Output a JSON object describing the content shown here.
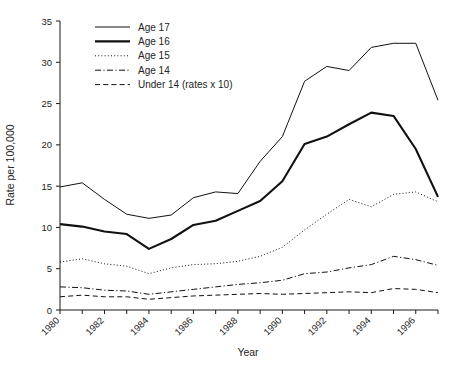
{
  "chart_data": {
    "type": "line",
    "title": "",
    "xlabel": "Year",
    "ylabel": "Rate per 100,000",
    "xlim": [
      1980,
      1997
    ],
    "ylim": [
      0,
      35
    ],
    "yticks": [
      0,
      5,
      10,
      15,
      20,
      25,
      30,
      35
    ],
    "xticks": [
      1980,
      1981,
      1982,
      1983,
      1984,
      1985,
      1986,
      1987,
      1988,
      1989,
      1990,
      1991,
      1992,
      1993,
      1994,
      1995,
      1996,
      1997
    ],
    "xtick_labels": [
      "1980",
      "",
      "1982",
      "",
      "1984",
      "",
      "1986",
      "",
      "1988",
      "",
      "1990",
      "",
      "1992",
      "",
      "1994",
      "",
      "1996",
      ""
    ],
    "grid": false,
    "legend_position": "top-left",
    "x": [
      1980,
      1981,
      1982,
      1983,
      1984,
      1985,
      1986,
      1987,
      1988,
      1989,
      1990,
      1991,
      1992,
      1993,
      1994,
      1995,
      1996,
      1997
    ],
    "series": [
      {
        "name": "Age 17",
        "style": "solid",
        "width": 1.0,
        "color": "#111111",
        "values": [
          14.9,
          15.4,
          13.4,
          11.6,
          11.1,
          11.5,
          13.6,
          14.3,
          14.1,
          18.0,
          21.0,
          27.7,
          29.5,
          29.0,
          31.8,
          32.3,
          32.3,
          25.4
        ]
      },
      {
        "name": "Age 16",
        "style": "solid",
        "width": 2.1,
        "color": "#111111",
        "values": [
          10.4,
          10.1,
          9.5,
          9.2,
          7.4,
          8.6,
          10.3,
          10.8,
          12.0,
          13.2,
          15.6,
          20.1,
          21.0,
          22.5,
          23.9,
          23.5,
          19.5,
          13.7
        ]
      },
      {
        "name": "Age 15",
        "style": "dotted",
        "width": 1.0,
        "color": "#111111",
        "values": [
          5.8,
          6.2,
          5.6,
          5.3,
          4.4,
          5.1,
          5.5,
          5.6,
          5.9,
          6.5,
          7.6,
          9.7,
          11.6,
          13.4,
          12.5,
          14.0,
          14.3,
          13.1
        ]
      },
      {
        "name": "Age 14",
        "style": "dashdot",
        "width": 1.0,
        "color": "#111111",
        "values": [
          2.8,
          2.7,
          2.4,
          2.3,
          1.9,
          2.2,
          2.5,
          2.8,
          3.1,
          3.3,
          3.6,
          4.4,
          4.6,
          5.1,
          5.5,
          6.5,
          6.1,
          5.4
        ]
      },
      {
        "name": "Under 14 (rates x 10)",
        "style": "dashed",
        "width": 1.0,
        "color": "#111111",
        "values": [
          1.6,
          1.8,
          1.6,
          1.6,
          1.3,
          1.5,
          1.7,
          1.8,
          1.9,
          2.0,
          1.9,
          2.0,
          2.1,
          2.2,
          2.1,
          2.6,
          2.5,
          2.1
        ]
      }
    ],
    "series_tail": {
      "Age 17": [
        24.0,
        20.4
      ],
      "Age 16": [
        16.2,
        13.7
      ],
      "Age 15": [
        9.4,
        6.3
      ],
      "Age 14": [
        4.3,
        2.4
      ],
      "Under 14 (rates x 10)": [
        1.9,
        1.5
      ]
    }
  },
  "legend": {
    "entries": [
      {
        "label": "Age 17"
      },
      {
        "label": "Age 16"
      },
      {
        "label": "Age 15"
      },
      {
        "label": "Age 14"
      },
      {
        "label": "Under 14 (rates x 10)"
      }
    ]
  },
  "axes": {
    "y_title": "Rate per 100,000",
    "x_title": "Year"
  }
}
